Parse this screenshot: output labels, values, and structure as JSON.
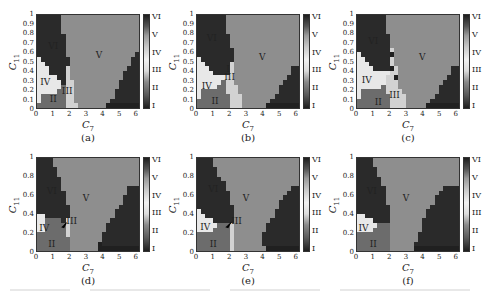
{
  "figure": {
    "panel_captions": [
      "(a)",
      "(b)",
      "(c)",
      "(d)",
      "(e)",
      "(f)"
    ],
    "xlabel_symbol": "C",
    "xlabel_sub": "7",
    "ylabel_symbol": "C",
    "ylabel_sub": "11",
    "x_ticks": [
      "0",
      "1",
      "2",
      "3",
      "4",
      "5",
      "6"
    ],
    "y_ticks_top_row": [
      "1",
      "0.9",
      "0.8",
      "0.7",
      "0.6",
      "0.5",
      "0.4",
      "0.3",
      "0.2",
      "0.1",
      "0"
    ],
    "y_ticks_other": [
      "1",
      "0.8",
      "0.6",
      "0.4",
      "0.2",
      "0"
    ],
    "colorbar_ticks": [
      "VI",
      "V",
      "IV",
      "III",
      "II",
      "I"
    ],
    "region_colors": {
      "1": "#202020",
      "2": "#6c6c6c",
      "3": "#d2d2d2",
      "4": "#e8e8e8",
      "5": "#8e8e8e",
      "6": "#2a2a2a"
    }
  },
  "chart_data": [
    {
      "type": "heatmap",
      "title": "(a)",
      "xlabel": "C7",
      "ylabel": "C11",
      "xlim": [
        0,
        6.25
      ],
      "ylim": [
        0,
        1
      ],
      "colorbar": [
        "I",
        "II",
        "III",
        "IV",
        "V",
        "VI"
      ],
      "grid_cols": 25,
      "grid_rows": 20,
      "rows_top_to_bottom": [
        "6666665555555555555555555",
        "6666665555555555555555555",
        "6666665555555555555555555",
        "6666665555555555555555555",
        "6666666555555555555555555",
        "6666666555555555555555555",
        "6666666555555555555555555",
        "6666666555555555555555555",
        "6666666555555555555555556",
        "4666666655555555555555566",
        "4466666655555555555555566",
        "4446666355555555555555666",
        "4446666355555555555556666",
        "4444466355555555555556666",
        "4444446335555555555566666",
        "4444442335555555555566666",
        "4444422335555555555666666",
        "4222222335555555555666666",
        "4222222335555555556666666",
        "2222222333555555511111111"
      ],
      "region_labels": [
        {
          "text": "VI",
          "x": 1.0,
          "y": 0.67
        },
        {
          "text": "V",
          "x": 3.8,
          "y": 0.57
        },
        {
          "text": "IV",
          "x": 0.5,
          "y": 0.28
        },
        {
          "text": "III",
          "x": 1.85,
          "y": 0.18
        },
        {
          "text": "II",
          "x": 1.0,
          "y": 0.1
        }
      ]
    },
    {
      "type": "heatmap",
      "title": "(b)",
      "xlabel": "C7",
      "ylabel": "C11",
      "xlim": [
        0,
        6.25
      ],
      "ylim": [
        0,
        1
      ],
      "colorbar": [
        "I",
        "II",
        "III",
        "IV",
        "V",
        "VI"
      ],
      "grid_cols": 25,
      "grid_rows": 20,
      "rows_top_to_bottom": [
        "6666666555555555555555555",
        "6666666555555555555555555",
        "6666666555555555555555555",
        "6666666555555555555555555",
        "6666666655555555555555555",
        "6666666655555555555555555",
        "6666666655555555555555555",
        "6666666665555555555555555",
        "6666666665555555555555555",
        "4666666665555555555555555",
        "4466666635555555555555555",
        "4446666635555555555555566",
        "4444666635555555555555566",
        "4444444335555555555555666",
        "4444442335555555555556666",
        "4444422333555555555566666",
        "4222222333555555555566666",
        "4222222233355555555666666",
        "2222222233355555556666666",
        "2222222233355555511111111"
      ],
      "region_labels": [
        {
          "text": "VI",
          "x": 0.9,
          "y": 0.75
        },
        {
          "text": "V",
          "x": 4.0,
          "y": 0.55
        },
        {
          "text": "I",
          "x": 1.9,
          "y": 0.42
        },
        {
          "text": "III",
          "x": 2.0,
          "y": 0.33
        },
        {
          "text": "IV",
          "x": 0.6,
          "y": 0.24
        },
        {
          "text": "II",
          "x": 1.1,
          "y": 0.07
        }
      ]
    },
    {
      "type": "heatmap",
      "title": "(c)",
      "xlabel": "C7",
      "ylabel": "C11",
      "xlim": [
        0,
        6.25
      ],
      "ylim": [
        0,
        1
      ],
      "colorbar": [
        "I",
        "II",
        "III",
        "IV",
        "V",
        "VI"
      ],
      "grid_cols": 25,
      "grid_rows": 20,
      "rows_top_to_bottom": [
        "6666666555555555555555555",
        "6666666555555555555555555",
        "6666666555555555555555555",
        "6666666555555555555555555",
        "6666666655555555555555555",
        "6666666655555555555555555",
        "6666666655555555555555555",
        "6666666635555555555555555",
        "4666666615555555555555555",
        "4466666635555555555555555",
        "4446666635555555555555555",
        "4444666613555555555555566",
        "4444444433555555555555566",
        "4444444331555555555555666",
        "4444444333555555555556666",
        "4444442333555555555566666",
        "4222222333355555555566666",
        "4222222233335555555666666",
        "2222222233335555556666666",
        "2222222233335555511111111"
      ],
      "region_labels": [
        {
          "text": "VI",
          "x": 1.0,
          "y": 0.72
        },
        {
          "text": "V",
          "x": 4.0,
          "y": 0.55
        },
        {
          "text": "IV",
          "x": 0.6,
          "y": 0.3
        },
        {
          "text": "III",
          "x": 2.3,
          "y": 0.14
        },
        {
          "text": "II",
          "x": 1.3,
          "y": 0.06
        }
      ]
    },
    {
      "type": "heatmap",
      "title": "(d)",
      "xlabel": "C7",
      "ylabel": "C11",
      "xlim": [
        0,
        6.25
      ],
      "ylim": [
        0,
        1
      ],
      "colorbar": [
        "I",
        "II",
        "III",
        "IV",
        "V",
        "VI"
      ],
      "grid_cols": 25,
      "grid_rows": 20,
      "rows_top_to_bottom": [
        "6666555555555555555555555",
        "6666555555555555555555555",
        "6666655555555555555555555",
        "6666655555555555555555555",
        "6666665555555555555555555",
        "6666665555555555555555555",
        "6666665555555555555555666",
        "6666666555555555555555666",
        "6666666555555555555556666",
        "6666666555555555555556666",
        "6666666655555555555566666",
        "6666666655555555555666666",
        "4466666655555555555666666",
        "4422226355555555556666666",
        "4422222355555555566666666",
        "4422222355555555566666666",
        "2222222355555555666666666",
        "2222222255555555666666666",
        "2222222255555551666666666",
        "2222222255555551111111111"
      ],
      "region_labels": [
        {
          "text": "VI",
          "x": 0.9,
          "y": 0.65
        },
        {
          "text": "V",
          "x": 3.0,
          "y": 0.57
        },
        {
          "text": "IV",
          "x": 0.45,
          "y": 0.25
        },
        {
          "text": "II",
          "x": 0.9,
          "y": 0.07
        }
      ],
      "annotations": [
        {
          "text": "III",
          "arrow_to": [
            1.45,
            0.27
          ],
          "label_at": [
            2.0,
            0.32
          ]
        }
      ]
    },
    {
      "type": "heatmap",
      "title": "(e)",
      "xlabel": "C7",
      "ylabel": "C11",
      "xlim": [
        0,
        6.25
      ],
      "ylim": [
        0,
        1
      ],
      "colorbar": [
        "I",
        "II",
        "III",
        "IV",
        "V",
        "VI"
      ],
      "grid_cols": 25,
      "grid_rows": 20,
      "rows_top_to_bottom": [
        "6666555555555555555555555",
        "6666555555555555555555555",
        "6666655555555555555555555",
        "6666655555555555555555555",
        "6666665555555555555555555",
        "6666666555555555555555555",
        "6666666555555555555555566",
        "6666666655555555555555666",
        "6666666655555555555556666",
        "6666666655555555555566666",
        "6666666665555555555566666",
        "4666666665555555555666666",
        "4466666665555555555666666",
        "4444666665555555556666666",
        "4444422235555555566666666",
        "4444222235555555566666666",
        "2222222235555555666666666",
        "2222222235555555666666666",
        "2222222235555555666666666",
        "2222222235555555511111111"
      ],
      "region_labels": [
        {
          "text": "VI",
          "x": 1.0,
          "y": 0.67
        },
        {
          "text": "V",
          "x": 3.0,
          "y": 0.57
        },
        {
          "text": "IV",
          "x": 0.5,
          "y": 0.26
        },
        {
          "text": "II",
          "x": 1.0,
          "y": 0.07
        }
      ],
      "annotations": [
        {
          "text": "III",
          "arrow_to": [
            1.7,
            0.27
          ],
          "label_at": [
            2.3,
            0.32
          ]
        }
      ]
    },
    {
      "type": "heatmap",
      "title": "(f)",
      "xlabel": "C7",
      "ylabel": "C11",
      "xlim": [
        0,
        6.25
      ],
      "ylim": [
        0,
        1
      ],
      "colorbar": [
        "I",
        "II",
        "III",
        "IV",
        "V",
        "VI"
      ],
      "grid_cols": 25,
      "grid_rows": 20,
      "rows_top_to_bottom": [
        "6666555555555555555555555",
        "6666555555555555555555555",
        "6666655555555555555555555",
        "6666655555555555555555555",
        "6666665555555555555555555",
        "6666665555555555555555555",
        "6666666555555555555556666",
        "6666666555555555555566666",
        "6666666555555555555666666",
        "6666666555555555555666666",
        "6666666655555555556666666",
        "6666666655555555566666666",
        "4466666655555555566666666",
        "4444666655555555666666666",
        "4444422255555555666666666",
        "4444222255555555666666666",
        "2222222255555556666666666",
        "2222222255555556666666666",
        "2222222255555566666666666",
        "2222222255555511111111111"
      ],
      "region_labels": [
        {
          "text": "VI",
          "x": 0.9,
          "y": 0.65
        },
        {
          "text": "V",
          "x": 3.0,
          "y": 0.57
        },
        {
          "text": "IV",
          "x": 0.4,
          "y": 0.25
        },
        {
          "text": "II",
          "x": 1.0,
          "y": 0.07
        }
      ]
    }
  ]
}
